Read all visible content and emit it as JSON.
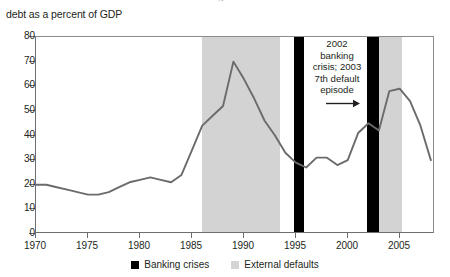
{
  "figure": {
    "title_remnant": "Argentina",
    "axis_caption": "debt as a percent of GDP"
  },
  "annotation": {
    "line1": "2002",
    "line2": "banking",
    "line3": "crisis; 2003",
    "line4": "7th default",
    "line5": "episode",
    "arrow_icon": "arrow-right-icon"
  },
  "legend": {
    "items": [
      {
        "label": "Banking crises",
        "color": "#000000",
        "swatch_icon": "black-square-icon"
      },
      {
        "label": "External defaults",
        "color": "#d3d3d3",
        "swatch_icon": "gray-square-icon"
      }
    ]
  },
  "chart_data": {
    "type": "line",
    "title": "",
    "subtitle": "debt as a percent of GDP",
    "xlabel": "",
    "ylabel": "debt as a percent of GDP",
    "xlim": [
      1970,
      2008.4
    ],
    "ylim": [
      0,
      80
    ],
    "yticks": [
      0,
      10,
      20,
      30,
      40,
      50,
      60,
      70,
      80
    ],
    "xticks": [
      1970,
      1975,
      1980,
      1985,
      1990,
      1995,
      2000,
      2005
    ],
    "grid": false,
    "legend_position": "bottom-center",
    "line_color": "#6b6b6d",
    "series": [
      {
        "name": "Argentina public debt as a percent of GDP",
        "x": [
          1970,
          1971,
          1972,
          1973,
          1974,
          1975,
          1976,
          1977,
          1978,
          1979,
          1980,
          1981,
          1982,
          1983,
          1984,
          1985,
          1986,
          1987,
          1988,
          1989,
          1990,
          1991,
          1992,
          1993,
          1994,
          1995,
          1996,
          1997,
          1998,
          1999,
          2000,
          2001,
          2002,
          2003,
          2004,
          2005,
          2006,
          2007,
          2008
        ],
        "values": [
          20,
          20,
          19,
          18,
          17,
          16,
          16,
          17,
          19,
          21,
          22,
          23,
          22,
          21,
          24,
          34,
          44,
          48,
          52,
          70,
          63,
          55,
          46,
          40,
          33,
          29,
          27,
          31,
          31,
          28,
          30,
          41,
          45,
          42,
          58,
          59,
          54,
          44,
          30
        ]
      }
    ],
    "shaded_bands": [
      {
        "type": "external_default",
        "label": "External defaults",
        "start": 1986.0,
        "end": 1993.5,
        "color": "#d3d3d3"
      },
      {
        "type": "banking_crisis",
        "label": "Banking crises",
        "start": 1994.8,
        "end": 1995.8,
        "color": "#000000"
      },
      {
        "type": "banking_crisis",
        "label": "Banking crises",
        "start": 2001.9,
        "end": 2003.0,
        "color": "#000000"
      },
      {
        "type": "external_default",
        "label": "External defaults",
        "start": 2003.0,
        "end": 2005.2,
        "color": "#d3d3d3"
      }
    ],
    "annotations": [
      {
        "text": "2002 banking crisis; 2003 7th default episode",
        "x": 2002,
        "y": 58
      }
    ]
  }
}
